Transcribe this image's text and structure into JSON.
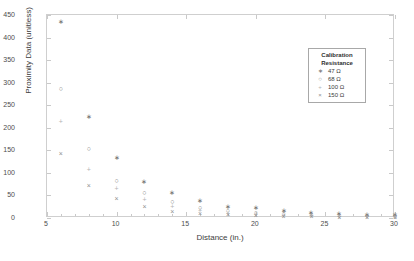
{
  "chart_data": {
    "type": "scatter",
    "title": "",
    "xlabel": "Distance (in.)",
    "ylabel": "Proximity Data (unitless)",
    "xlim": [
      5,
      30
    ],
    "ylim": [
      0,
      450
    ],
    "xticks": [
      5,
      10,
      15,
      20,
      25,
      30
    ],
    "yticks": [
      0,
      50,
      100,
      150,
      200,
      250,
      300,
      350,
      400,
      450
    ],
    "xtick_labels": [
      "5",
      "10",
      "15",
      "20",
      "25",
      "30"
    ],
    "ytick_labels": [
      "0",
      "50",
      "100",
      "150",
      "200",
      "250",
      "300",
      "350",
      "400",
      "450"
    ],
    "grid": false,
    "legend_position": "upper right",
    "legend_title_line1": "Calibration",
    "legend_title_line2": "Resistance",
    "series": [
      {
        "name": "47 Ω",
        "marker": "asterisk",
        "marker_glyph": "∗",
        "color": "#6b6b6b",
        "x": [
          6,
          8,
          10,
          12,
          14,
          16,
          18,
          20,
          22,
          24,
          26,
          28,
          30
        ],
        "y": [
          435,
          226,
          134,
          81,
          57,
          38,
          26,
          24,
          16,
          13,
          11,
          8,
          7
        ]
      },
      {
        "name": "68 Ω",
        "marker": "circle",
        "marker_glyph": "○",
        "color": "#7a7a7a",
        "x": [
          6,
          8,
          10,
          12,
          14,
          16,
          18,
          20,
          22,
          24,
          26,
          28,
          30
        ],
        "y": [
          287,
          155,
          83,
          57,
          37,
          23,
          17,
          12,
          9,
          7,
          6,
          5,
          4
        ]
      },
      {
        "name": "100 Ω",
        "marker": "plus",
        "marker_glyph": "+",
        "color": "#b4b4b4",
        "x": [
          6,
          8,
          10,
          12,
          14,
          16,
          18,
          20,
          22,
          24,
          26,
          28,
          30
        ],
        "y": [
          215,
          108,
          65,
          40,
          25,
          16,
          11,
          8,
          6,
          5,
          4,
          3,
          3
        ]
      },
      {
        "name": "150 Ω",
        "marker": "cross",
        "marker_glyph": "×",
        "color": "#8f8f8f",
        "x": [
          6,
          8,
          10,
          12,
          14,
          16,
          18,
          20,
          22,
          24,
          26,
          28,
          30
        ],
        "y": [
          142,
          73,
          44,
          26,
          15,
          11,
          7,
          5,
          4,
          3,
          2,
          2,
          2
        ]
      }
    ]
  }
}
